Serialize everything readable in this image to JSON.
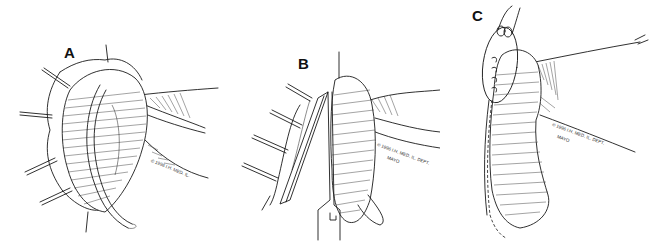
{
  "figure": {
    "background_color": "#ffffff",
    "ink_color": "#1a1a1a",
    "panels": [
      {
        "id": "A",
        "label": "A",
        "copyright": "© 1996 I.H. MED. IL."
      },
      {
        "id": "B",
        "label": "B",
        "copyright": "© 1996 I.H. MED. IL. DEPT.",
        "copyright_line2": "MAYO"
      },
      {
        "id": "C",
        "label": "C",
        "copyright": "© 1996 I.H. MED. IL. DEPT.",
        "copyright_line2": "MAYO"
      }
    ]
  }
}
